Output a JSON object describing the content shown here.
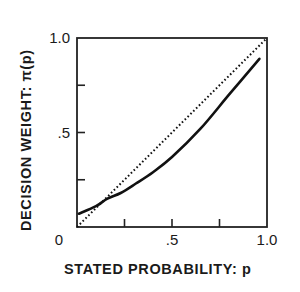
{
  "chart_data": {
    "type": "line",
    "title": "",
    "xlabel": "STATED PROBABILITY: p",
    "ylabel": "DECISION WEIGHT: π(p)",
    "xlim": [
      0,
      1.0
    ],
    "ylim": [
      0,
      1.0
    ],
    "grid": false,
    "legend": null,
    "x_tick_labels": [
      {
        "value": 0,
        "label": "0"
      },
      {
        "value": 0.5,
        "label": ".5"
      },
      {
        "value": 1.0,
        "label": "1.0"
      }
    ],
    "y_tick_labels": [
      {
        "value": 0.5,
        "label": ".5"
      },
      {
        "value": 1.0,
        "label": "1.0"
      }
    ],
    "x_ticks": [
      0.25,
      0.5,
      0.75
    ],
    "y_ticks": [
      0.25,
      0.5,
      0.75
    ],
    "series": [
      {
        "name": "decision weight π(p)",
        "style": "solid",
        "x": [
          0.01,
          0.1,
          0.16,
          0.23,
          0.31,
          0.4,
          0.5,
          0.65,
          0.8,
          0.96
        ],
        "y": [
          0.07,
          0.11,
          0.15,
          0.18,
          0.23,
          0.29,
          0.37,
          0.52,
          0.7,
          0.89
        ]
      },
      {
        "name": "identity (π(p) = p)",
        "style": "dotted",
        "x": [
          0,
          1.0
        ],
        "y": [
          0,
          1.0
        ]
      }
    ]
  }
}
